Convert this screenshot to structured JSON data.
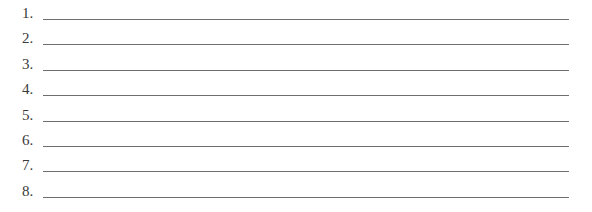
{
  "items": [
    {
      "number": "1.",
      "value": ""
    },
    {
      "number": "2.",
      "value": ""
    },
    {
      "number": "3.",
      "value": ""
    },
    {
      "number": "4.",
      "value": ""
    },
    {
      "number": "5.",
      "value": ""
    },
    {
      "number": "6.",
      "value": ""
    },
    {
      "number": "7.",
      "value": ""
    },
    {
      "number": "8.",
      "value": ""
    }
  ]
}
